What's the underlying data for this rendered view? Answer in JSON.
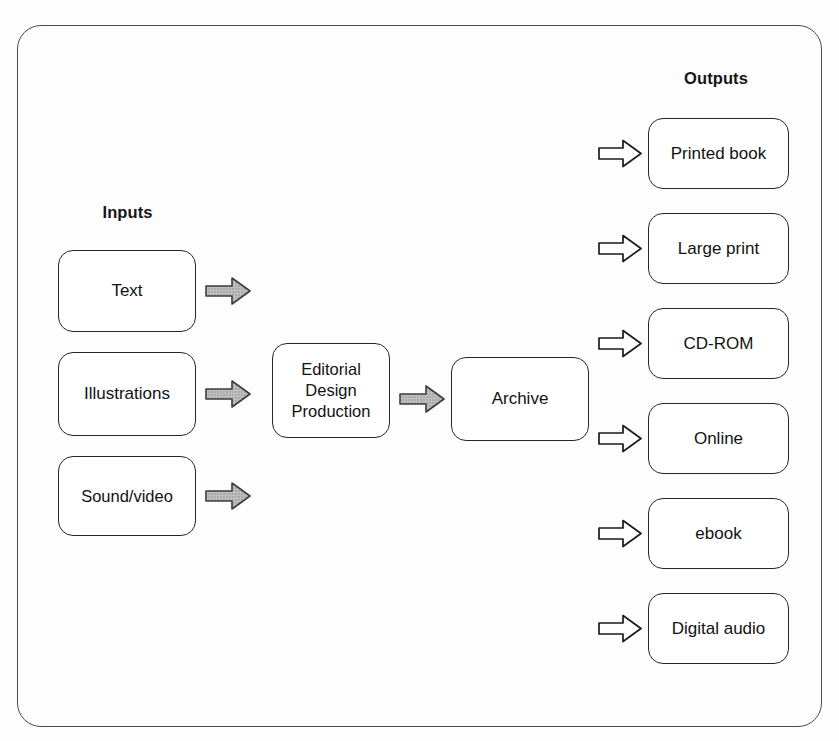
{
  "diagram": {
    "colors": {
      "frame_stroke": "#4a4a4a",
      "box_stroke": "#262626",
      "box_fill": "#ffffff",
      "text": "#121212",
      "solid_arrow_fill": "#b4b4b4",
      "solid_arrow_stroke": "#3c3c3c",
      "hollow_arrow_fill": "#ffffff",
      "hollow_arrow_stroke": "#1a1a1a",
      "background": "#fdfdfd"
    },
    "headings": {
      "inputs": "Inputs",
      "outputs": "Outputs"
    },
    "inputs": [
      {
        "id": "text",
        "label": "Text"
      },
      {
        "id": "illustrations",
        "label": "Illustrations"
      },
      {
        "id": "sound-video",
        "label": "Sound/video"
      }
    ],
    "process": {
      "editorial": {
        "id": "editorial",
        "lines": [
          "Editorial",
          "Design",
          "Production"
        ]
      },
      "archive": {
        "id": "archive",
        "label": "Archive"
      }
    },
    "outputs": [
      {
        "id": "printed-book",
        "label": "Printed book"
      },
      {
        "id": "large-print",
        "label": "Large print"
      },
      {
        "id": "cd-rom",
        "label": "CD-ROM"
      },
      {
        "id": "online",
        "label": "Online"
      },
      {
        "id": "ebook",
        "label": "ebook"
      },
      {
        "id": "digital-audio",
        "label": "Digital audio"
      }
    ],
    "arrows": {
      "solid_style": "filled-grey-block-arrow",
      "hollow_style": "outline-block-arrow",
      "direction": "right"
    }
  }
}
